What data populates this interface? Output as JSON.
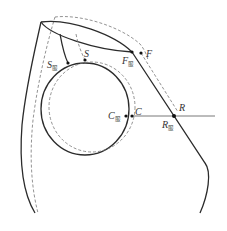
{
  "diagram": {
    "labels": {
      "S": "S",
      "S_garment": "S",
      "F": "F",
      "F_garment": "F",
      "C": "C",
      "C_garment": "C",
      "R": "R",
      "R_garment": "R",
      "garment_subscript": "服"
    },
    "colors": {
      "solid_line": "#2b2b2b",
      "dashed_line": "#777777",
      "point": "#111111",
      "background": "#ffffff"
    }
  }
}
